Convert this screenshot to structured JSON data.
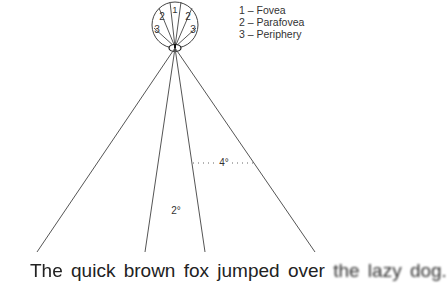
{
  "legend": [
    {
      "label": "1 – Fovea"
    },
    {
      "label": "2 – Parafovea"
    },
    {
      "label": "3 – Periphery"
    }
  ],
  "eye_regions": {
    "fovea": "1",
    "parafovea": "2",
    "periphery": "3"
  },
  "angles": {
    "wide": "4°",
    "narrow": "2°"
  },
  "sentence": {
    "blurred_start": "The",
    "sharp": "quick brown fox jumped over",
    "blurred_end": "the lazy dog."
  }
}
